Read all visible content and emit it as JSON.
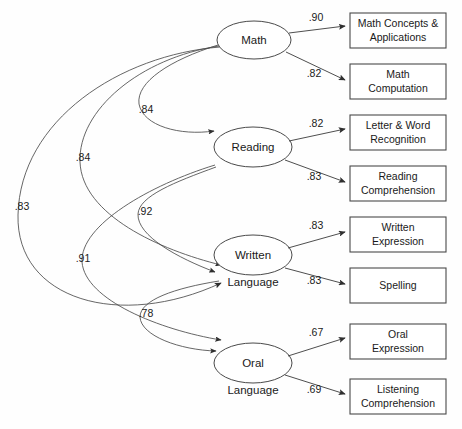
{
  "diagram": {
    "type": "path-diagram",
    "title": "",
    "factors": [
      {
        "id": "math",
        "label_line1": "Math",
        "label_line2": "",
        "cx": 254,
        "cy": 40,
        "rx": 37,
        "ry": 19
      },
      {
        "id": "reading",
        "label_line1": "Reading",
        "label_line2": "",
        "cx": 253,
        "cy": 147,
        "rx": 39,
        "ry": 20
      },
      {
        "id": "written",
        "label_line1": "Written",
        "label_line2": "Language",
        "cx": 253,
        "cy": 255,
        "rx": 39,
        "ry": 20
      },
      {
        "id": "oral",
        "label_line1": "Oral",
        "label_line2": "Language",
        "cx": 253,
        "cy": 363,
        "rx": 39,
        "ry": 20
      }
    ],
    "indicators": [
      {
        "id": "math-concepts",
        "line1": "Math Concepts &",
        "line2": "Applications",
        "x": 350,
        "y": 13,
        "w": 96,
        "h": 35
      },
      {
        "id": "math-computation",
        "line1": "Math",
        "line2": "Computation",
        "x": 350,
        "y": 64,
        "w": 96,
        "h": 35
      },
      {
        "id": "letter-word-recognition",
        "line1": "Letter & Word",
        "line2": "Recognition",
        "x": 350,
        "y": 115,
        "w": 96,
        "h": 35
      },
      {
        "id": "reading-comprehension",
        "line1": "Reading",
        "line2": "Comprehension",
        "x": 350,
        "y": 166,
        "w": 96,
        "h": 35
      },
      {
        "id": "written-expression",
        "line1": "Written",
        "line2": "Expression",
        "x": 350,
        "y": 217,
        "w": 96,
        "h": 35
      },
      {
        "id": "spelling",
        "line1": "Spelling",
        "line2": "",
        "x": 350,
        "y": 268,
        "w": 96,
        "h": 35
      },
      {
        "id": "oral-expression",
        "line1": "Oral",
        "line2": "Expression",
        "x": 350,
        "y": 324,
        "w": 96,
        "h": 35
      },
      {
        "id": "listening-comprehension",
        "line1": "Listening",
        "line2": "Comprehension",
        "x": 350,
        "y": 379,
        "w": 96,
        "h": 35
      }
    ],
    "loadings": [
      {
        "id": "l-math-concepts",
        "from": "math",
        "to": "math-concepts",
        "value": ".90",
        "lx": 316,
        "ly": 18
      },
      {
        "id": "l-math-computation",
        "from": "math",
        "to": "math-computation",
        "value": ".82",
        "lx": 314,
        "ly": 74
      },
      {
        "id": "l-letter-word",
        "from": "reading",
        "to": "letter-word-recognition",
        "value": ".82",
        "lx": 316,
        "ly": 124
      },
      {
        "id": "l-reading-comprehension",
        "from": "reading",
        "to": "reading-comprehension",
        "value": ".83",
        "lx": 314,
        "ly": 177
      },
      {
        "id": "l-written-expression",
        "from": "written",
        "to": "written-expression",
        "value": ".83",
        "lx": 316,
        "ly": 226
      },
      {
        "id": "l-spelling",
        "from": "written",
        "to": "spelling",
        "value": ".83",
        "lx": 314,
        "ly": 281
      },
      {
        "id": "l-oral-expression",
        "from": "oral",
        "to": "oral-expression",
        "value": ".67",
        "lx": 316,
        "ly": 333
      },
      {
        "id": "l-listening-comprehension",
        "from": "oral",
        "to": "listening-comprehension",
        "value": ".69",
        "lx": 314,
        "ly": 390
      }
    ],
    "correlations": [
      {
        "id": "c-math-reading",
        "between": [
          "Math",
          "Reading"
        ],
        "value": ".84",
        "lx": 146,
        "ly": 110
      },
      {
        "id": "c-math-written",
        "between": [
          "Math",
          "Written Language"
        ],
        "value": ".84",
        "lx": 83,
        "ly": 158
      },
      {
        "id": "c-math-oral",
        "between": [
          "Math",
          "Oral Language"
        ],
        "value": ".83",
        "lx": 22,
        "ly": 207
      },
      {
        "id": "c-reading-written",
        "between": [
          "Reading",
          "Written Language"
        ],
        "value": ".92",
        "lx": 145,
        "ly": 212
      },
      {
        "id": "c-reading-oral",
        "between": [
          "Reading",
          "Oral Language"
        ],
        "value": ".91",
        "lx": 83,
        "ly": 259
      },
      {
        "id": "c-written-oral",
        "between": [
          "Written Language",
          "Oral Language"
        ],
        "value": ".78",
        "lx": 146,
        "ly": 314
      }
    ]
  }
}
